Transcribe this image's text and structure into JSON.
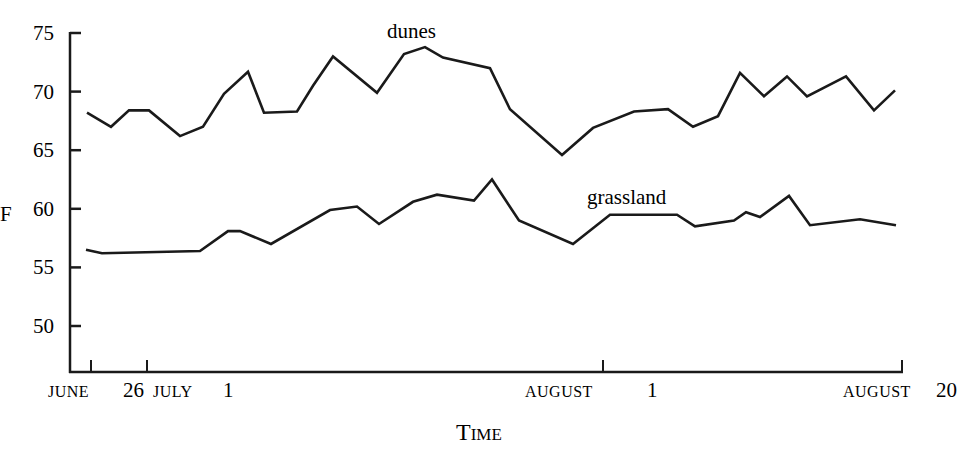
{
  "chart_data": {
    "type": "line",
    "title": "",
    "xlabel": "Time",
    "ylabel": "F",
    "ylim": [
      46,
      75
    ],
    "yticks": [
      50,
      55,
      60,
      65,
      70,
      75
    ],
    "ytick_labels": [
      "50",
      "55",
      "60",
      "65",
      "70",
      "75"
    ],
    "xticks": [
      {
        "label_sc": "June",
        "label_num": "26"
      },
      {
        "label_sc": "July",
        "label_num": "1"
      },
      {
        "label_sc": "August",
        "label_num": "1"
      },
      {
        "label_sc": "August",
        "label_num": "20"
      }
    ],
    "grid": false,
    "legend": "inline labels",
    "series": [
      {
        "name": "dunes",
        "x": [
          87,
          111,
          129,
          149,
          180,
          203,
          224,
          248,
          264,
          297,
          313,
          333,
          377,
          404,
          425,
          443,
          490,
          510,
          562,
          593,
          634,
          668,
          693,
          718,
          740,
          764,
          787,
          807,
          846,
          874,
          895
        ],
        "values": [
          68.2,
          67.0,
          68.4,
          68.4,
          66.2,
          67.0,
          69.8,
          71.7,
          68.2,
          68.3,
          70.5,
          73.0,
          69.9,
          73.2,
          73.8,
          72.9,
          72.0,
          68.5,
          64.6,
          66.9,
          68.3,
          68.5,
          67.0,
          67.9,
          71.6,
          69.6,
          71.3,
          69.6,
          71.3,
          68.4,
          70.1
        ]
      },
      {
        "name": "grassland",
        "x": [
          86,
          102,
          200,
          228,
          240,
          271,
          330,
          357,
          379,
          413,
          437,
          474,
          492,
          519,
          573,
          610,
          677,
          695,
          734,
          746,
          760,
          789,
          810,
          860,
          896
        ],
        "values": [
          56.5,
          56.2,
          56.4,
          58.1,
          58.1,
          57.0,
          59.9,
          60.2,
          58.7,
          60.6,
          61.2,
          60.7,
          62.5,
          59.0,
          57.0,
          59.5,
          59.5,
          58.5,
          59.0,
          59.7,
          59.3,
          61.1,
          58.6,
          59.1,
          58.6
        ]
      }
    ]
  },
  "labels": {
    "y_unit": "F",
    "x_title": "Time",
    "dunes": "dunes",
    "grassland": "grassland"
  }
}
